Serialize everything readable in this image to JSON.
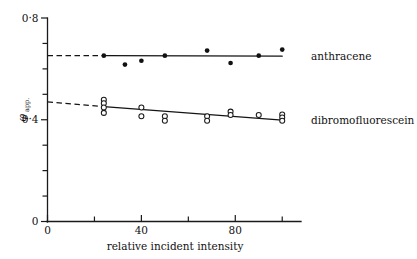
{
  "figure": {
    "background": "#ffffff",
    "ink_color": "#111111"
  },
  "chart_data": {
    "type": "scatter",
    "title": "",
    "subtitle": "",
    "xlabel": "relative incident intensity",
    "ylabel": "φ",
    "ylabel_subscript": "app.",
    "xlim": [
      0,
      108
    ],
    "ylim": [
      0,
      0.8
    ],
    "grid": false,
    "legend_position": "right-inline",
    "x_ticks": [
      0,
      20,
      40,
      60,
      80,
      100
    ],
    "x_tick_labels": [
      "0",
      "",
      "40",
      "",
      "80",
      ""
    ],
    "y_ticks": [
      0,
      0.1,
      0.2,
      0.3,
      0.4,
      0.5,
      0.6,
      0.7,
      0.8
    ],
    "y_tick_labels": [
      "0",
      "",
      "",
      "",
      "0·4",
      "",
      "",
      "",
      "0·8"
    ],
    "annotations": [],
    "series": [
      {
        "name": "anthracene",
        "label": "anthracene",
        "marker": "filled-circle",
        "marker_color": "#111111",
        "fit_line": {
          "style": "solid",
          "x_start": 24,
          "y_start": 0.652,
          "x_end": 100,
          "y_end": 0.65
        },
        "extrapolation": {
          "style": "dashed",
          "x_start": 0,
          "y_start": 0.652,
          "x_end": 24,
          "y_end": 0.652
        },
        "points": [
          {
            "x": 24,
            "y": 0.652
          },
          {
            "x": 33,
            "y": 0.617
          },
          {
            "x": 40,
            "y": 0.632
          },
          {
            "x": 50,
            "y": 0.652
          },
          {
            "x": 68,
            "y": 0.672
          },
          {
            "x": 78,
            "y": 0.623
          },
          {
            "x": 90,
            "y": 0.652
          },
          {
            "x": 100,
            "y": 0.676
          }
        ]
      },
      {
        "name": "dibromofluorescein",
        "label": "dibromofluorescein",
        "marker": "open-circle",
        "marker_color": "#ffffff",
        "marker_edge_color": "#1a1a1a",
        "fit_line": {
          "style": "solid",
          "x_start": 24,
          "y_start": 0.452,
          "x_end": 100,
          "y_end": 0.399
        },
        "extrapolation": {
          "style": "dashed",
          "x_start": 0,
          "y_start": 0.47,
          "x_end": 24,
          "y_end": 0.452
        },
        "points": [
          {
            "x": 24,
            "y": 0.479
          },
          {
            "x": 24,
            "y": 0.465
          },
          {
            "x": 24,
            "y": 0.448
          },
          {
            "x": 24,
            "y": 0.427
          },
          {
            "x": 40,
            "y": 0.448
          },
          {
            "x": 40,
            "y": 0.414
          },
          {
            "x": 50,
            "y": 0.414
          },
          {
            "x": 50,
            "y": 0.396
          },
          {
            "x": 68,
            "y": 0.414
          },
          {
            "x": 68,
            "y": 0.396
          },
          {
            "x": 78,
            "y": 0.432
          },
          {
            "x": 78,
            "y": 0.419
          },
          {
            "x": 90,
            "y": 0.419
          },
          {
            "x": 100,
            "y": 0.421
          },
          {
            "x": 100,
            "y": 0.409
          },
          {
            "x": 100,
            "y": 0.396
          }
        ]
      }
    ]
  }
}
